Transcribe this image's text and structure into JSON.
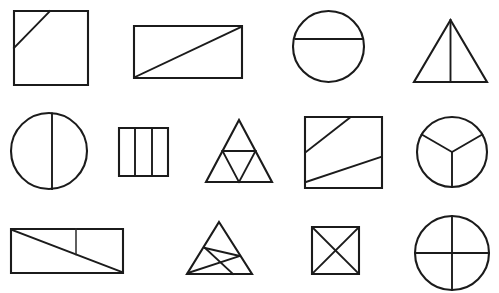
{
  "page": {
    "background_color": "#ffffff",
    "stroke_color": "#1b1b1b",
    "canvas": {
      "width": 499,
      "height": 293
    },
    "grid": {
      "rows": 3,
      "columns": 4,
      "total_figures": 12
    }
  },
  "figures": [
    {
      "id": "figure-1",
      "row": 1,
      "column": 1,
      "name": "square-with-partial-diagonal",
      "shape": "square",
      "label": "Square with short diagonal segment from left side to top side",
      "parts": 2,
      "bounds": {
        "x": 14,
        "y": 11,
        "width": 74,
        "height": 74
      },
      "outline": "M14,11 L88,11 L88,85 L14,85 Z",
      "dividers": [
        "M14,48 L50,11"
      ]
    },
    {
      "id": "figure-2",
      "row": 1,
      "column": 2,
      "name": "rectangle-with-diagonal",
      "shape": "rectangle",
      "label": "Rectangle split into two triangles by a corner-to-corner diagonal",
      "parts": 2,
      "bounds": {
        "x": 134,
        "y": 26,
        "width": 108,
        "height": 52
      },
      "outline": "M134,26 L242,26 L242,78 L134,78 Z",
      "dividers": [
        "M135,77 L241,27"
      ]
    },
    {
      "id": "figure-3",
      "row": 1,
      "column": 3,
      "name": "circle-with-horizontal-chord",
      "shape": "circle",
      "label": "Circle cut by a horizontal chord above the centre",
      "parts": 2,
      "bounds": {
        "x": 293,
        "y": 11,
        "width": 71,
        "height": 71
      },
      "center": {
        "cx": 328.5,
        "cy": 46.5,
        "r": 35.5
      },
      "dividers": [
        "M295.5,39 L362,39"
      ]
    },
    {
      "id": "figure-4",
      "row": 1,
      "column": 4,
      "name": "triangle-with-vertical-median",
      "shape": "triangle",
      "label": "Triangle split into two halves by a vertical line from apex to base midpoint",
      "parts": 2,
      "bounds": {
        "x": 414,
        "y": 20,
        "width": 73,
        "height": 62
      },
      "outline": "M450.5,20 L487,82 L414,82 Z",
      "dividers": [
        "M450.5,20 L450.5,82"
      ]
    },
    {
      "id": "figure-5",
      "row": 2,
      "column": 1,
      "name": "circle-with-vertical-diameter",
      "shape": "circle",
      "label": "Circle split by a near-vertical diameter line",
      "parts": 2,
      "bounds": {
        "x": 11,
        "y": 113,
        "width": 76,
        "height": 76
      },
      "center": {
        "cx": 49,
        "cy": 151,
        "r": 38
      },
      "dividers": [
        "M52,113.5 L52,189"
      ]
    },
    {
      "id": "figure-6",
      "row": 2,
      "column": 2,
      "name": "rectangle-three-vertical-strips",
      "shape": "rectangle",
      "label": "Rectangle divided into three equal vertical strips",
      "parts": 3,
      "bounds": {
        "x": 119,
        "y": 128,
        "width": 49,
        "height": 48
      },
      "outline": "M119,128 L168,128 L168,176 L119,176 Z",
      "dividers": [
        "M135,128 L135,176",
        "M152,128 L152,176"
      ]
    },
    {
      "id": "figure-7",
      "row": 2,
      "column": 3,
      "name": "triangle-with-medial-triangle",
      "shape": "triangle",
      "label": "Triangle divided into four smaller triangles by joining the midpoints of its sides",
      "parts": 4,
      "bounds": {
        "x": 206,
        "y": 120,
        "width": 66,
        "height": 62
      },
      "outline": "M239,120 L272,182 L206,182 Z",
      "dividers": [
        "M222.5,151 L255.5,151",
        "M222.5,151 L239,182",
        "M255.5,151 L239,182"
      ]
    },
    {
      "id": "figure-8",
      "row": 2,
      "column": 4,
      "name": "square-with-two-oblique-lines",
      "shape": "square",
      "label": "Square crossed by two oblique lines creating three regions",
      "parts": 3,
      "bounds": {
        "x": 305,
        "y": 117,
        "width": 77,
        "height": 71
      },
      "outline": "M305,117 L382,117 L382,188 L305,188 Z",
      "dividers": [
        "M306,152 L350,117.5",
        "M306,182 L381,157"
      ]
    },
    {
      "id": "figure-9",
      "row": 2,
      "column": 4,
      "name": "circle-three-sectors",
      "shape": "circle",
      "label": "Circle divided into three equal sectors meeting at the centre",
      "parts": 3,
      "bounds": {
        "x": 417,
        "y": 117,
        "width": 70,
        "height": 70
      },
      "center": {
        "cx": 452,
        "cy": 152,
        "r": 35
      },
      "dividers": [
        "M452,152 L452,187",
        "M452,152 L421.7,134.5",
        "M452,152 L482.3,134.5"
      ]
    },
    {
      "id": "figure-10",
      "row": 3,
      "column": 1,
      "name": "rectangle-diagonal-with-vertical-segment",
      "shape": "rectangle",
      "label": "Rectangle with a full diagonal plus a short vertical segment from the top edge to the diagonal",
      "parts": 3,
      "bounds": {
        "x": 11,
        "y": 229,
        "width": 112,
        "height": 44
      },
      "outline": "M11,229 L123,229 L123,273 L11,273 Z",
      "dividers": [
        "M12,230 L122,272",
        "M76,229 L76,254.5"
      ]
    },
    {
      "id": "figure-11",
      "row": 3,
      "column": 2,
      "name": "triangle-with-three-cevians",
      "shape": "triangle",
      "label": "Triangle crossed by three internal lines forming four regions",
      "parts": 4,
      "bounds": {
        "x": 187,
        "y": 222,
        "width": 65,
        "height": 52
      },
      "outline": "M219,222 L252,274 L187,274 Z",
      "dividers": [
        "M205,248 L233,274",
        "M205,248 L240,256",
        "M188,273 L240,256"
      ]
    },
    {
      "id": "figure-12",
      "row": 3,
      "column": 3,
      "name": "square-with-both-diagonals",
      "shape": "square",
      "label": "Square divided into four triangles by both diagonals",
      "parts": 4,
      "bounds": {
        "x": 312,
        "y": 227,
        "width": 47,
        "height": 47
      },
      "outline": "M312,227 L359,227 L359,274 L312,274 Z",
      "dividers": [
        "M312.5,227.5 L358.5,273.5",
        "M358.5,227.5 L312.5,273.5"
      ]
    },
    {
      "id": "figure-13",
      "row": 3,
      "column": 4,
      "name": "circle-quartered",
      "shape": "circle",
      "label": "Circle divided into four quarters by a vertical and a horizontal diameter",
      "parts": 4,
      "bounds": {
        "x": 415,
        "y": 216,
        "width": 74,
        "height": 74
      },
      "center": {
        "cx": 452,
        "cy": 253,
        "r": 37
      },
      "dividers": [
        "M452,216 L452,290",
        "M415,253 L489,253"
      ]
    }
  ]
}
